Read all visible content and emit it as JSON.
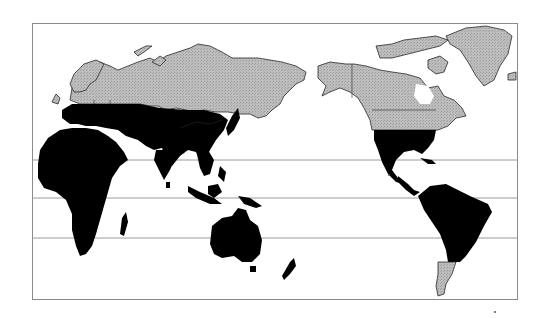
{
  "map": {
    "projection": "Pacific-centered world map",
    "legend": [],
    "fills": {
      "tropical_region": "#000000",
      "temperate_region": "#b4b4b4",
      "border_lines": "#2a2a2a",
      "frame": "#8a8a8a",
      "gridlines": "#9a9a9a",
      "ocean": "#ffffff"
    },
    "gridlines_y": [
      160,
      198,
      238
    ],
    "frame": {
      "x": 32,
      "y": 23,
      "width": 486,
      "height": 277
    }
  }
}
